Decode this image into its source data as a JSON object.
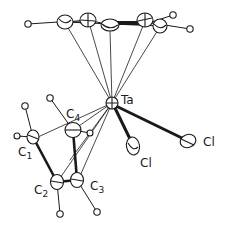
{
  "diagram": {
    "type": "ORTEP molecular structure",
    "colors": {
      "ink": "#1a1a1a",
      "background": "#ffffff"
    },
    "labels": {
      "metal": "Ta",
      "chlorine_1": "Cl",
      "chlorine_2": "Cl",
      "c1": {
        "base": "C",
        "sub": "1"
      },
      "c2": {
        "base": "C",
        "sub": "2"
      },
      "c3": {
        "base": "C",
        "sub": "3"
      },
      "c4": {
        "base": "C",
        "sub": "4"
      }
    },
    "atoms": [
      {
        "id": "Ta",
        "x": 112,
        "y": 103
      },
      {
        "id": "Cl_a",
        "x": 133,
        "y": 146
      },
      {
        "id": "Cl_b",
        "x": 188,
        "y": 141
      },
      {
        "id": "C1",
        "x": 33,
        "y": 137
      },
      {
        "id": "C2",
        "x": 57,
        "y": 182
      },
      {
        "id": "C3",
        "x": 77,
        "y": 180
      },
      {
        "id": "C4",
        "x": 73,
        "y": 130
      },
      {
        "id": "Cp1",
        "x": 65,
        "y": 22
      },
      {
        "id": "Cp2",
        "x": 88,
        "y": 20
      },
      {
        "id": "Cp3",
        "x": 110,
        "y": 25
      },
      {
        "id": "Cp4",
        "x": 145,
        "y": 20
      },
      {
        "id": "Cp5",
        "x": 160,
        "y": 26
      }
    ]
  }
}
